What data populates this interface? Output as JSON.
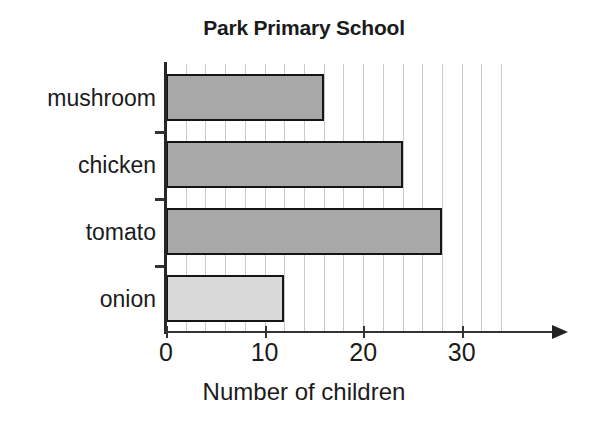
{
  "chart_data": {
    "type": "bar",
    "orientation": "horizontal",
    "title": "Park Primary School",
    "xlabel": "Number of children",
    "ylabel": "",
    "categories": [
      "mushroom",
      "chicken",
      "tomato",
      "onion"
    ],
    "values": [
      16,
      24,
      28,
      12
    ],
    "xlim": [
      0,
      35
    ],
    "xticks": [
      0,
      10,
      20,
      30
    ],
    "xtick_labels": [
      "0",
      "10",
      "20",
      "30"
    ],
    "grid": true,
    "grid_axis": "x",
    "grid_interval": 2,
    "legend": "none",
    "bar_colors": [
      "#a8a8a8",
      "#a8a8a8",
      "#a8a8a8",
      "#d9d9d9"
    ],
    "bar_edge_color": "#151515",
    "axis_color": "#333333",
    "gridline_color": "#c9c9c9",
    "axis_arrow": true
  },
  "axis": {
    "x_arrow_name": "x-axis-arrow"
  }
}
